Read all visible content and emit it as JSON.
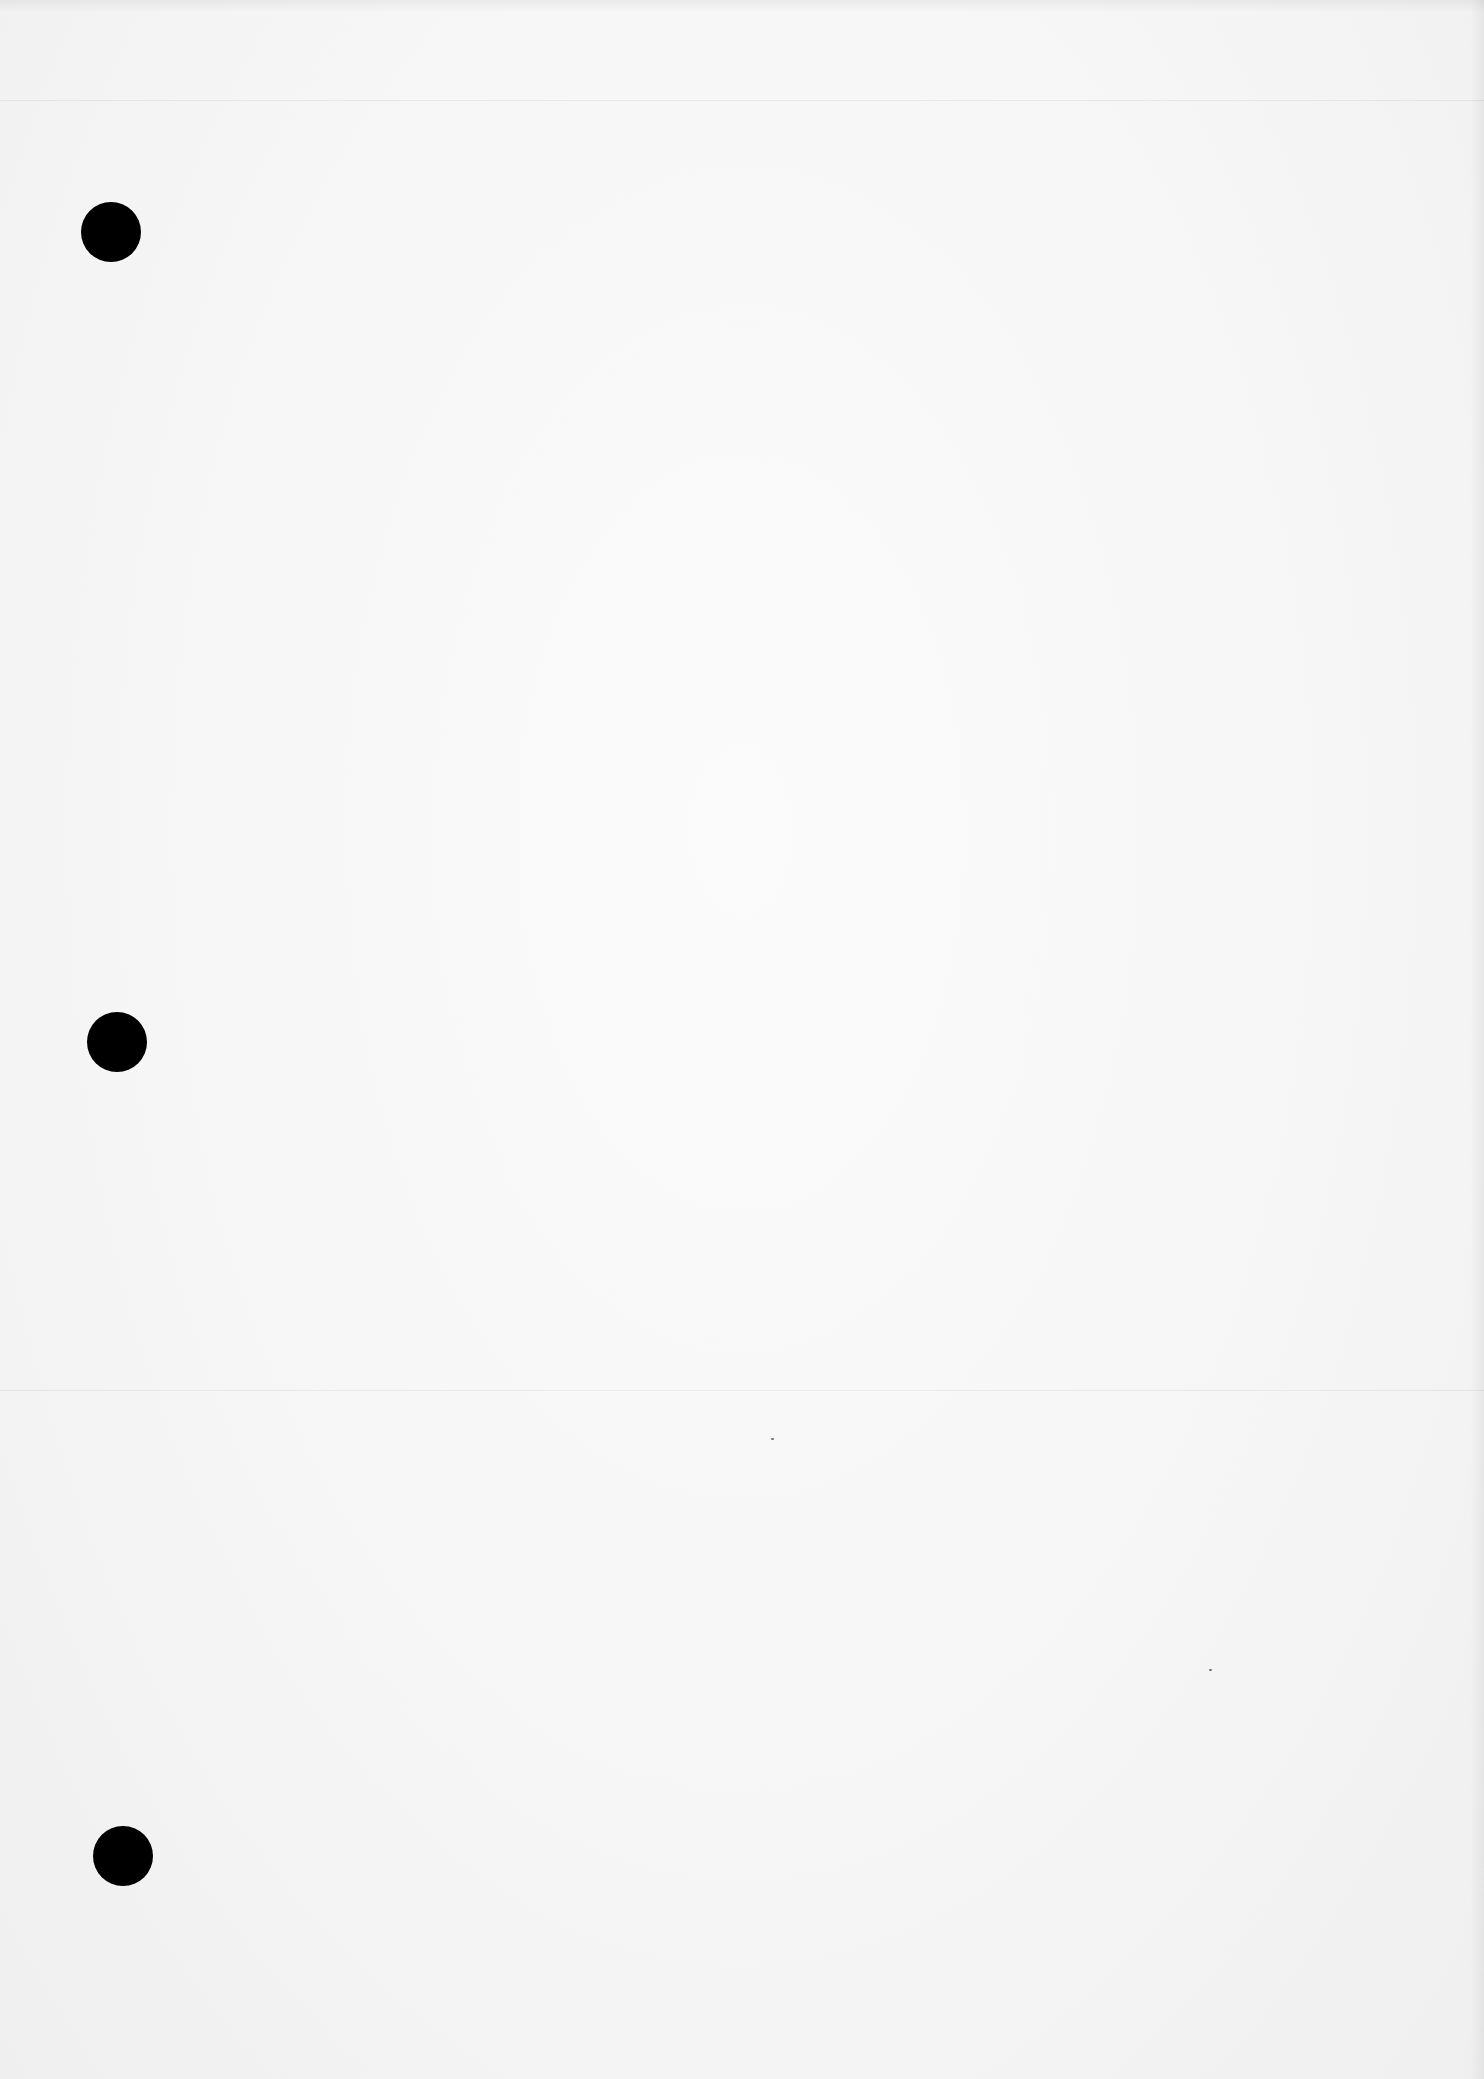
{
  "document": {
    "type": "blank-scanned-page",
    "text_content": "",
    "paper_color": "#f7f7f7",
    "punch_holes": [
      {
        "id": "top",
        "cx": 111,
        "cy": 232,
        "diameter": 60,
        "color": "#000000"
      },
      {
        "id": "middle",
        "cx": 117,
        "cy": 1042,
        "diameter": 60,
        "color": "#000000"
      },
      {
        "id": "bottom",
        "cx": 123,
        "cy": 1856,
        "diameter": 60,
        "color": "#000000"
      }
    ]
  }
}
